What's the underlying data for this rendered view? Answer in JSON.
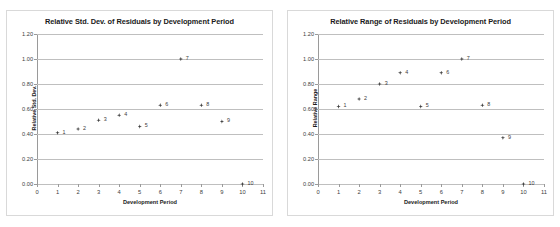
{
  "figure": {
    "width": 560,
    "height": 227,
    "background": "#ffffff",
    "panel_border_color": "#d9d9d9",
    "gridline_color": "#bfbfbf",
    "marker_color": "#3f3f3f"
  },
  "chart_data": [
    {
      "type": "scatter",
      "panel": "left",
      "title": "Relative Std. Dev. of Residuals by Development Period",
      "xlabel": "Development Period",
      "ylabel": "Relative Std. Dev.",
      "xlim": [
        0,
        11
      ],
      "ylim": [
        0,
        1.2
      ],
      "xticks": [
        0,
        1,
        2,
        3,
        4,
        5,
        6,
        7,
        8,
        9,
        10,
        11
      ],
      "xticklabels": [
        "0",
        "1",
        "2",
        "3",
        "4",
        "5",
        "6",
        "7",
        "8",
        "9",
        "10",
        "11"
      ],
      "yticks": [
        0.0,
        0.2,
        0.4,
        0.6,
        0.8,
        1.0,
        1.2
      ],
      "yticklabels": [
        "0.00",
        "0.20",
        "0.40",
        "0.60",
        "0.80",
        "1.00",
        "1.20"
      ],
      "grid": true,
      "legend": false,
      "x": [
        1,
        2,
        3,
        4,
        5,
        6,
        7,
        8,
        9,
        10
      ],
      "values": [
        0.41,
        0.44,
        0.51,
        0.55,
        0.46,
        0.63,
        1.0,
        0.63,
        0.5,
        0.0
      ],
      "point_labels": [
        "1",
        "2",
        "3",
        "4",
        "5",
        "6",
        "7",
        "8",
        "9",
        "10"
      ]
    },
    {
      "type": "scatter",
      "panel": "right",
      "title": "Relative Range of Residuals by Development Period",
      "xlabel": "Development Period",
      "ylabel": "Relative Range",
      "xlim": [
        0,
        11
      ],
      "ylim": [
        0,
        1.2
      ],
      "xticks": [
        0,
        1,
        2,
        3,
        4,
        5,
        6,
        7,
        8,
        9,
        10,
        11
      ],
      "xticklabels": [
        "0",
        "1",
        "2",
        "3",
        "4",
        "5",
        "6",
        "7",
        "8",
        "9",
        "10",
        "11"
      ],
      "yticks": [
        0.0,
        0.2,
        0.4,
        0.6,
        0.8,
        1.0,
        1.2
      ],
      "yticklabels": [
        "0.00",
        "0.20",
        "0.40",
        "0.60",
        "0.80",
        "1.00",
        "1.20"
      ],
      "grid": true,
      "legend": false,
      "x": [
        1,
        2,
        3,
        4,
        5,
        6,
        7,
        8,
        9,
        10
      ],
      "values": [
        0.62,
        0.68,
        0.8,
        0.89,
        0.62,
        0.89,
        1.0,
        0.63,
        0.37,
        0.0
      ],
      "point_labels": [
        "1",
        "2",
        "3",
        "4",
        "5",
        "6",
        "7",
        "8",
        "9",
        "10"
      ]
    }
  ]
}
